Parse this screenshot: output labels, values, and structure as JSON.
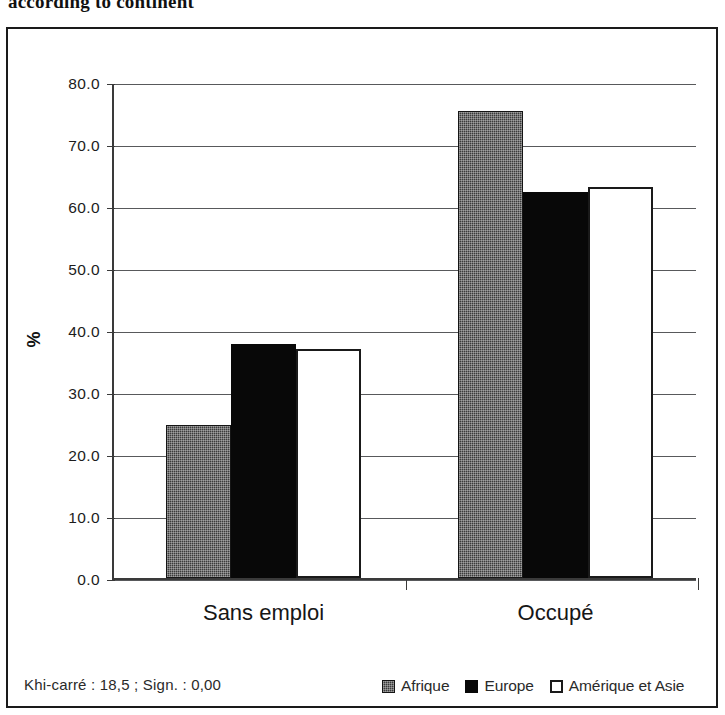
{
  "title": "according to continent",
  "footer_note": "Khi-carré : 18,5 ; Sign. : 0,00",
  "y_axis_title": "%",
  "legend": {
    "items": [
      {
        "label": "Afrique",
        "swatch": "dark-gray-dither-swatch"
      },
      {
        "label": "Europe",
        "swatch": "black-swatch"
      },
      {
        "label": "Amérique et Asie",
        "swatch": "white-outlined-swatch"
      }
    ]
  },
  "chart_data": {
    "type": "bar",
    "title": "according to continent",
    "xlabel": "",
    "ylabel": "%",
    "ylim": [
      0,
      80
    ],
    "ytick_labels": [
      "0.0",
      "10.0",
      "20.0",
      "30.0",
      "40.0",
      "50.0",
      "60.0",
      "70.0",
      "80.0"
    ],
    "yticks": [
      0,
      10,
      20,
      30,
      40,
      50,
      60,
      70,
      80
    ],
    "grid": true,
    "legend_position": "bottom-right",
    "categories": [
      "Sans emploi",
      "Occupé"
    ],
    "series": [
      {
        "name": "Afrique",
        "values": [
          24.6,
          75.4
        ]
      },
      {
        "name": "Europe",
        "values": [
          37.8,
          62.2
        ]
      },
      {
        "name": "Amérique et Asie",
        "values": [
          36.9,
          63.1
        ]
      }
    ],
    "annotations": [
      "Khi-carré : 18,5 ; Sign. : 0,00"
    ]
  }
}
